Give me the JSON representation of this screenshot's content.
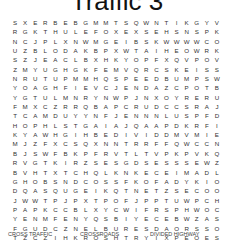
{
  "title": "Traffic 3",
  "grid": [
    "SXERBEBGMMTSQWNTIKGYVYOD",
    "RGKTHULEFOXEXSEHSNSPKYUJ",
    "NCJPLXNWMGEIBSKWWWWCOMRG",
    "UZBLODAKBPXWTAIHEOWRKINA",
    "SZJEACLBXHKYOPFXQVPOVIBT",
    "ZMYUGHGKFEMVQRCSKEISSYEF",
    "NRUTUPMMHQSPEEDBUMPSWSFB",
    "YOAGHFIEVCJENDAZCPOTBTQO",
    "YGTULMNRYNWPJNXOYRERUJJN",
    "FMXCZRRQBAPCRUDCCSRAJASE",
    "TCAMDUYYNFJENNNLUSPFDXJW",
    "HOPHLSTGAIAJQAAPDKRFIYIA",
    "KYAWHGIHBEDIVIDDMVMIEOTY",
    "MJZFXCSQXNNTRRFFQWCCNWRS",
    "BJSWFBKPFRVTLTVPKPVKQOOT",
    "RVGTKIRZSESGDSESSSEWZCTR",
    "BVHTXTCHQLKNKECEIMADLDDE",
    "GHOBSNDCOSSFKOFADYKIOCFE",
    "DQASQUGEIKQTNETZSECOOTQT",
    "JWWTPJPXTPOFJPPTUWPCHLKH",
    "PAPKCCBLXYCWIFRSPHWOCQDJ",
    "YENMFENYQSBIYECEBWZASYQL",
    "FGUDCZNELBURESDAORSSORCA",
    "TZCZIHKROSHTRYIXPEOESIMS"
  ],
  "word_list": [
    "CROSS TRAFFIC",
    "CROSSROADS",
    "DIVIDED HIGHWAY"
  ]
}
